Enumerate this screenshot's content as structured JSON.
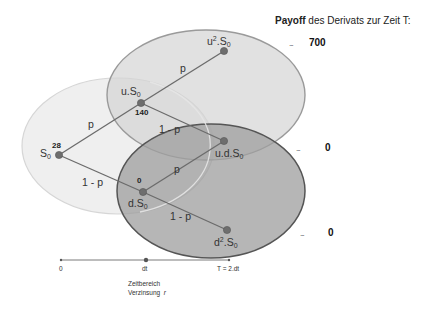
{
  "title": {
    "bold": "Payoff",
    "rest": " des Derivats zur Zeit T:"
  },
  "colors": {
    "light_ellipse_fill": "#ececec",
    "light_ellipse_stroke": "#d6d6d6",
    "upper_ellipse_fill": "#d9d9d9",
    "upper_ellipse_stroke": "#9a9a9a",
    "lower_ellipse_fill": "#a9a9a9",
    "lower_ellipse_stroke": "#595959",
    "edge": "#6b6b6b",
    "node": "#6e6e6e",
    "timeline": "#7a7a7a"
  },
  "nodes": {
    "s0": {
      "base": "S",
      "sub": "0",
      "prefix": "",
      "sup": "",
      "value": "28"
    },
    "us0": {
      "prefix": "u.S",
      "sub": "0",
      "value": "140"
    },
    "u2s0": {
      "prefix": "u",
      "sup": "2",
      "mid": ".S",
      "sub": "0"
    },
    "ds0": {
      "prefix": "d.S",
      "sub": "0",
      "value": "0"
    },
    "uds0": {
      "prefix": "u.d.S",
      "sub": "0"
    },
    "d2s0": {
      "prefix": "d",
      "sup": "2",
      "mid": ".S",
      "sub": "0"
    }
  },
  "edges": {
    "p1": "p",
    "q1": "1 - p",
    "p2_up": "p",
    "q2_up": "1 - p",
    "p2_down": "p",
    "q2_down": "1 - p"
  },
  "payoffs": [
    {
      "ellipsis": "...",
      "value": "700"
    },
    {
      "ellipsis": "...",
      "value": "0"
    },
    {
      "ellipsis": "...",
      "value": "0"
    }
  ],
  "timeline": {
    "ticks": [
      "0",
      "dt",
      "T = 2.dt"
    ],
    "caption_line1": "Zeitbereich",
    "caption_line2": "Verzinsung",
    "caption_var": "r"
  }
}
